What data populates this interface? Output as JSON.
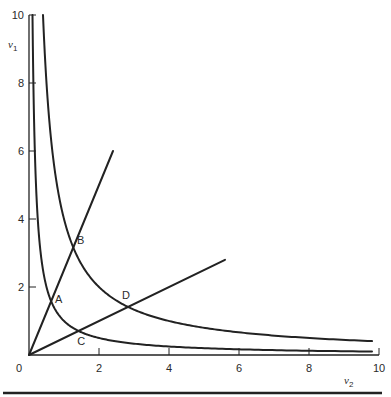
{
  "chart_data": {
    "type": "line",
    "title": "",
    "xlabel": "ν",
    "xlabel_sub": "2",
    "ylabel": "ν",
    "ylabel_sub": "1",
    "xlim": [
      0,
      10
    ],
    "ylim": [
      0,
      10
    ],
    "grid": false,
    "x_ticks": [
      {
        "value": 0,
        "label": "0"
      },
      {
        "value": 2,
        "label": "2"
      },
      {
        "value": 4,
        "label": "4"
      },
      {
        "value": 6,
        "label": "6"
      },
      {
        "value": 8,
        "label": "8"
      },
      {
        "value": 10,
        "label": "10"
      }
    ],
    "y_ticks": [
      {
        "value": 2,
        "label": "2"
      },
      {
        "value": 4,
        "label": "4"
      },
      {
        "value": 6,
        "label": "6"
      },
      {
        "value": 8,
        "label": "8"
      },
      {
        "value": 10,
        "label": "10"
      }
    ],
    "series": [
      {
        "name": "hyperbola-inner",
        "kind": "hyperbola",
        "equation": "v1*v2 = 1",
        "k": 1,
        "x_range": [
          0.1,
          9.8
        ]
      },
      {
        "name": "hyperbola-outer",
        "kind": "hyperbola",
        "equation": "v1*v2 = 4",
        "k": 4,
        "x_range": [
          0.4,
          9.8
        ]
      },
      {
        "name": "ray-steep",
        "kind": "ray",
        "equation": "v1 = 2.5*v2",
        "from": [
          0,
          0
        ],
        "to": [
          2.4,
          6.0
        ]
      },
      {
        "name": "ray-shallow",
        "kind": "ray",
        "equation": "v1 = 0.5*v2",
        "from": [
          0,
          0
        ],
        "to": [
          5.6,
          2.8
        ]
      }
    ],
    "points": [
      {
        "label": "A",
        "x": 0.63,
        "y": 1.58
      },
      {
        "label": "B",
        "x": 1.26,
        "y": 3.16
      },
      {
        "label": "C",
        "x": 1.41,
        "y": 0.71
      },
      {
        "label": "D",
        "x": 2.83,
        "y": 1.41
      }
    ],
    "colors": {
      "ink": "#222222"
    }
  }
}
